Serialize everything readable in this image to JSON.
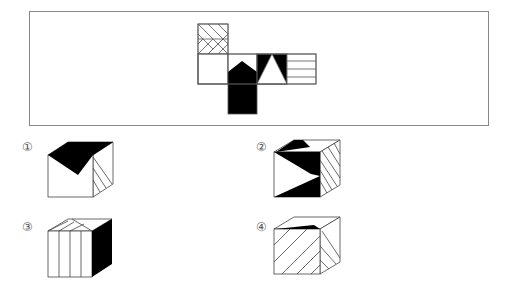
{
  "puzzle": {
    "type": "cube-net-folding",
    "net_faces": [
      {
        "id": "A",
        "pattern": "chevron-hatch-pointing-right"
      },
      {
        "id": "B",
        "pattern": "black-house-pentagon"
      },
      {
        "id": "C",
        "pattern": "white-triangle-on-black-corners"
      },
      {
        "id": "D",
        "pattern": "horizontal-lines"
      },
      {
        "id": "E",
        "pattern": "solid-black"
      },
      {
        "id": "F",
        "pattern": "blank"
      }
    ]
  },
  "options": [
    {
      "label": "①",
      "description": "black chevron on top, blank front, diagonal hatch on right"
    },
    {
      "label": "②",
      "description": "black triangles on front and top, diagonal hatch on right"
    },
    {
      "label": "③",
      "description": "vertical lines on front and top, solid black on right"
    },
    {
      "label": "④",
      "description": "diagonal hatch on front and right, black wedge on top"
    }
  ]
}
